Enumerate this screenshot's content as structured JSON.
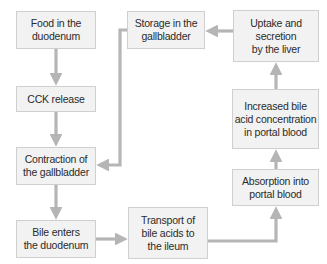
{
  "diagram": {
    "colors": {
      "box_fill": "#f2f2f2",
      "box_border": "#cfcfcf",
      "arrow": "#b5b5b5",
      "text": "#2b2b2b"
    },
    "nodes": [
      {
        "id": "food",
        "label": "Food in the\nduodenum"
      },
      {
        "id": "cck",
        "label": "CCK release"
      },
      {
        "id": "contraction",
        "label": "Contraction of\nthe gallbladder"
      },
      {
        "id": "bile",
        "label": "Bile enters\nthe duodenum"
      },
      {
        "id": "transport",
        "label": "Transport of\nbile acids to\nthe ileum"
      },
      {
        "id": "absorption",
        "label": "Absorption into\nportal blood"
      },
      {
        "id": "increased",
        "label": "Increased bile\nacid concentration\nin portal blood"
      },
      {
        "id": "uptake",
        "label": "Uptake and\nsecretion\nby the liver"
      },
      {
        "id": "storage",
        "label": "Storage in the\ngallbladder"
      }
    ],
    "edges": [
      {
        "from": "food",
        "to": "cck"
      },
      {
        "from": "cck",
        "to": "contraction"
      },
      {
        "from": "contraction",
        "to": "bile"
      },
      {
        "from": "bile",
        "to": "transport"
      },
      {
        "from": "transport",
        "to": "absorption"
      },
      {
        "from": "absorption",
        "to": "increased"
      },
      {
        "from": "increased",
        "to": "uptake"
      },
      {
        "from": "uptake",
        "to": "storage"
      },
      {
        "from": "storage",
        "to": "contraction"
      }
    ]
  }
}
